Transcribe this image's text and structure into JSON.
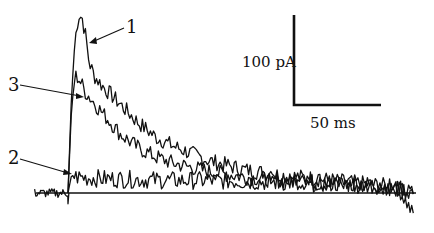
{
  "chart_data": {
    "type": "line",
    "title": "",
    "xlabel": "",
    "ylabel": "",
    "grid": false,
    "legend": "inline numbered labels with arrows",
    "x_units": "ms",
    "y_units": "pA",
    "onset_ms": 0,
    "x_range_ms": [
      -19,
      197
    ],
    "scale_bar": {
      "vertical_label": "100 pA",
      "vertical_value": 100,
      "horizontal_label": "50 ms",
      "horizontal_value": 50
    },
    "series": [
      {
        "name": "1",
        "description": "largest current, fast peak then slow decay",
        "x": [
          -19,
          0,
          2,
          4,
          6,
          8,
          10,
          12,
          15,
          20,
          30,
          40,
          50,
          60,
          70,
          80,
          100,
          120,
          140,
          160,
          180,
          197
        ],
        "values": [
          0,
          0,
          110,
          170,
          198,
          195,
          175,
          145,
          130,
          118,
          98,
          78,
          62,
          52,
          44,
          36,
          26,
          20,
          16,
          12,
          8,
          0
        ]
      },
      {
        "name": "3",
        "description": "intermediate current",
        "x": [
          -19,
          0,
          2,
          4,
          6,
          10,
          15,
          20,
          30,
          40,
          50,
          60,
          80,
          100,
          120,
          140,
          160,
          180,
          197
        ],
        "values": [
          0,
          0,
          95,
          130,
          128,
          112,
          100,
          88,
          65,
          50,
          40,
          33,
          24,
          18,
          14,
          11,
          9,
          7,
          0
        ]
      },
      {
        "name": "2",
        "description": "small sustained current",
        "x": [
          -19,
          0,
          2,
          4,
          10,
          20,
          40,
          60,
          80,
          100,
          120,
          140,
          160,
          180,
          197
        ],
        "values": [
          0,
          0,
          20,
          18,
          17,
          16,
          15,
          14,
          14,
          13,
          12,
          11,
          10,
          8,
          0
        ]
      }
    ]
  },
  "figure": {
    "labels": {
      "trace1": "1",
      "trace2": "2",
      "trace3": "3"
    },
    "scale": {
      "current": "100 pA",
      "time": "50 ms"
    }
  }
}
